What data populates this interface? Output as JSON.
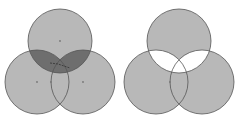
{
  "diagram": {
    "colors": {
      "circle_fill": "#b8b8b8",
      "circle_stroke": "#555555",
      "shaded_region": "#6e6e6e",
      "removed_region": "#ffffff",
      "background": "#ffffff"
    },
    "figures": [
      {
        "name": "left",
        "circles": [
          {
            "id": "top",
            "cx": 60,
            "cy": 41,
            "r": 32
          },
          {
            "id": "bottom-left",
            "cx": 37,
            "cy": 82,
            "r": 32
          },
          {
            "id": "bottom-right",
            "cx": 83,
            "cy": 82,
            "r": 32
          }
        ],
        "highlighted_region": "top ∩ (bottom-left ∪ bottom-right)",
        "highlight_style": "dark shaded"
      },
      {
        "name": "right",
        "circles": [
          {
            "id": "top",
            "cx": 179,
            "cy": 41,
            "r": 32
          },
          {
            "id": "bottom-left",
            "cx": 156,
            "cy": 82,
            "r": 32
          },
          {
            "id": "bottom-right",
            "cx": 202,
            "cy": 82,
            "r": 32
          }
        ],
        "highlighted_region": "top ∩ (bottom-left ∪ bottom-right)",
        "highlight_style": "white (removed)"
      }
    ]
  }
}
